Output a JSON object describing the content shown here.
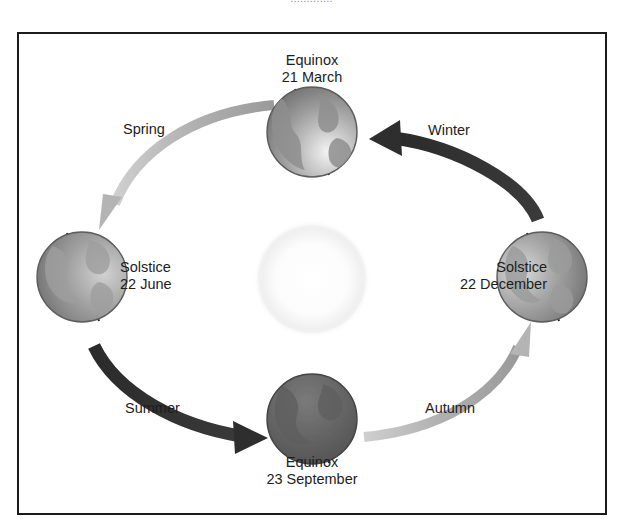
{
  "page": {
    "background_color": "#ffffff",
    "cut_caption": "............."
  },
  "figure": {
    "frame_color": "#1b1b1b",
    "sun": {
      "name": "Sun",
      "color": "#fdfdfd",
      "glow_color": "#f2f2f2"
    },
    "positions": [
      {
        "id": "march",
        "event": "Equinox",
        "date": "21 March",
        "location": "top",
        "globe_shade": "lit-lower-right"
      },
      {
        "id": "june",
        "event": "Solstice",
        "date": "22 June",
        "location": "left",
        "globe_shade": "lit-right"
      },
      {
        "id": "september",
        "event": "Equinox",
        "date": "23 September",
        "location": "bottom",
        "globe_shade": "dark"
      },
      {
        "id": "december",
        "event": "Solstice",
        "date": "22 December",
        "location": "right",
        "globe_shade": "lit-left"
      }
    ],
    "seasons": [
      {
        "id": "spring",
        "label": "Spring",
        "arrow_tone": "light",
        "arrow_color": "#b4b4b4",
        "from": "december",
        "to": "june"
      },
      {
        "id": "winter",
        "label": "Winter",
        "arrow_tone": "dark",
        "arrow_color": "#2e2e2e",
        "from": "december",
        "to": "march"
      },
      {
        "id": "summer",
        "label": "Summer",
        "arrow_tone": "dark",
        "arrow_color": "#2e2e2e",
        "from": "june",
        "to": "september"
      },
      {
        "id": "autumn",
        "label": "Autumn",
        "arrow_tone": "light",
        "arrow_color": "#b4b4b4",
        "from": "september",
        "to": "december"
      }
    ]
  }
}
